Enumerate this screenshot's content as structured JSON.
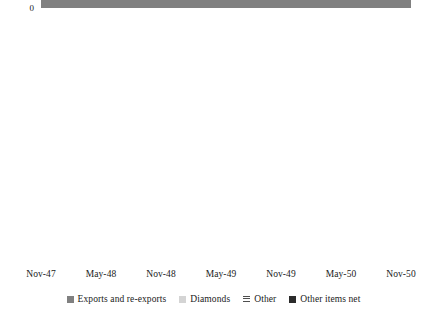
{
  "chart_data": {
    "type": "area",
    "stacked": true,
    "title": "",
    "subtitle": "",
    "xlabel": "",
    "ylabel": "",
    "ylim": [
      -120,
      0
    ],
    "xlim": [
      "Nov-47",
      "Nov-50"
    ],
    "grid": false,
    "legend_position": "bottom",
    "y_ticks": [
      "0",
      "-20",
      "-40",
      "-60",
      "-80",
      "-100",
      "-120"
    ],
    "y_tick_values": [
      0,
      -20,
      -40,
      -60,
      -80,
      -100,
      -120
    ],
    "x_ticks": [
      "Nov-47",
      "May-48",
      "Nov-48",
      "May-49",
      "Nov-49",
      "May-50",
      "Nov-50"
    ],
    "colors": {
      "exports_and_re_exports": "#808080",
      "diamonds": "#d4d4d4",
      "other": "#6e6e6e",
      "other_items_net": "#2b2b2b",
      "background": "#ffffff",
      "text": "#1a1a1a"
    },
    "x": [
      "Nov-47",
      "Dec-47",
      "Jan-48",
      "Feb-48",
      "Mar-48",
      "Apr-48",
      "May-48",
      "Jun-48",
      "Jul-48",
      "Aug-48",
      "Sep-48",
      "Oct-48",
      "Nov-48",
      "Dec-48",
      "Jan-49",
      "Feb-49",
      "Mar-49",
      "Apr-49",
      "May-49",
      "Jun-49",
      "Jul-49",
      "Aug-49",
      "Sep-49",
      "Oct-49",
      "Nov-49",
      "Dec-49",
      "Jan-50",
      "Feb-50",
      "Mar-50",
      "Apr-50",
      "May-50",
      "Jun-50",
      "Jul-50",
      "Aug-50",
      "Sep-50",
      "Oct-50",
      "Nov-50",
      "Dec-50"
    ],
    "series": [
      {
        "name": "Exports and re-exports",
        "key": "exports_and_re_exports",
        "color": "#808080",
        "values": [
          -21.5,
          -22.0,
          -21.0,
          -22.5,
          -23.0,
          -22.0,
          -21.5,
          -23.0,
          -22.5,
          -22.0,
          -23.5,
          -22.5,
          -15.0,
          -23.0,
          -21.5,
          -22.5,
          -22.0,
          -24.0,
          -23.0,
          -22.5,
          -24.0,
          -22.0,
          -23.5,
          -16.0,
          -22.0,
          -13.0,
          -20.5,
          -22.0,
          -21.5,
          -23.0,
          -22.0,
          -12.0,
          -23.5,
          -22.0,
          -20.5,
          -12.5,
          -17.5,
          -21.5
        ]
      },
      {
        "name": "Diamonds",
        "key": "diamonds",
        "color": "#d4d4d4",
        "values": [
          -2.5,
          -3.0,
          -2.0,
          -2.5,
          -3.0,
          -2.5,
          -2.0,
          -3.0,
          -2.5,
          -2.0,
          -3.0,
          -2.5,
          -1.0,
          -3.0,
          -2.5,
          -3.0,
          -2.5,
          -3.5,
          -3.0,
          -2.5,
          -4.5,
          -3.0,
          -3.5,
          -1.5,
          -5.0,
          -1.5,
          -3.0,
          -3.5,
          -3.0,
          -5.5,
          -6.5,
          -2.0,
          -4.0,
          -5.0,
          -8.5,
          -2.5,
          -4.5,
          -3.0
        ]
      },
      {
        "name": "Other",
        "key": "other",
        "color": "#6e6e6e",
        "pattern": "horizontal-stripes",
        "values": [
          -11.0,
          -13.0,
          -16.0,
          -12.5,
          -10.0,
          -8.0,
          -6.5,
          -8.0,
          -10.5,
          -12.0,
          -13.5,
          -11.0,
          -4.5,
          -10.5,
          -12.5,
          -14.5,
          -16.5,
          -20.0,
          -22.5,
          -12.0,
          -6.0,
          -10.0,
          -13.0,
          -6.5,
          -9.5,
          -6.0,
          -14.0,
          -18.5,
          -12.5,
          -8.0,
          -6.0,
          -5.5,
          -11.0,
          -14.5,
          -12.0,
          -7.0,
          -10.0,
          -12.5
        ]
      },
      {
        "name": "Other items net",
        "key": "other_items_net",
        "color": "#2b2b2b",
        "values": [
          -5.5,
          -9.0,
          -7.5,
          -2.5,
          -2.0,
          -3.0,
          -2.0,
          -3.5,
          -4.5,
          -6.5,
          -3.5,
          -2.0,
          -0.5,
          -6.0,
          -10.5,
          -6.5,
          -4.0,
          -4.0,
          -2.5,
          -14.0,
          -21.5,
          -10.0,
          -6.0,
          -26.0,
          -7.0,
          -21.5,
          -7.5,
          -5.5,
          -13.5,
          -6.0,
          -6.5,
          -26.0,
          -5.0,
          -8.5,
          -4.5,
          -97.0,
          -12.0,
          -6.0
        ]
      }
    ]
  },
  "legend": {
    "items": [
      {
        "label": "Exports and re-exports",
        "swatch": "#808080",
        "pattern": "solid"
      },
      {
        "label": "Diamonds",
        "swatch": "#d4d4d4",
        "pattern": "solid"
      },
      {
        "label": "Other",
        "swatch": "#6e6e6e",
        "pattern": "horizontal-stripes"
      },
      {
        "label": "Other items net",
        "swatch": "#2b2b2b",
        "pattern": "solid"
      }
    ]
  }
}
